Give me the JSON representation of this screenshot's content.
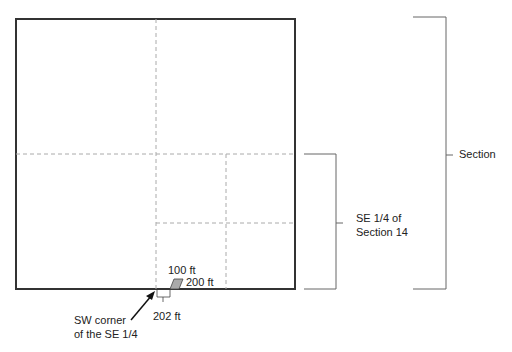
{
  "diagram": {
    "labels": {
      "section": "Section",
      "se_quarter_line1": "SE 1/4 of",
      "se_quarter_line2": "Section 14",
      "dim_100": "100 ft",
      "dim_200": "200 ft",
      "dim_202": "202 ft",
      "sw_corner_line1": "SW corner",
      "sw_corner_line2": "of the SE 1/4"
    },
    "colors": {
      "outline": "#333333",
      "dashed": "#aaaaaa",
      "bracket": "#666666",
      "parcel_fill": "#aaaaaa"
    }
  }
}
